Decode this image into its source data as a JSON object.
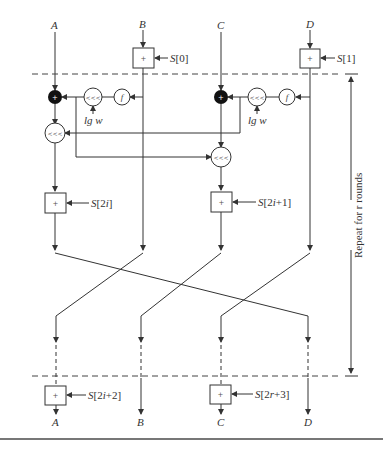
{
  "inputs": {
    "a": "A",
    "b": "B",
    "c": "C",
    "d": "D"
  },
  "outputs": {
    "a": "A",
    "b": "B",
    "c": "C",
    "d": "D"
  },
  "pre_whitening": {
    "b_key": "S[0]",
    "d_key": "S[1]"
  },
  "round": {
    "add_symbol": "+",
    "rotate_symbol": "<<<",
    "function_symbol": "f",
    "rotate_amount": "lg w",
    "key_left": "S[2i]",
    "key_right": "S[2i+1]"
  },
  "post_whitening": {
    "a_key": "S[2i+2]",
    "c_key": "S[2r+3]"
  },
  "repeat_label": "Repeat for r rounds",
  "colors": {
    "line": "#333333",
    "dashed": "#444444",
    "xor_fill": "#111111"
  }
}
